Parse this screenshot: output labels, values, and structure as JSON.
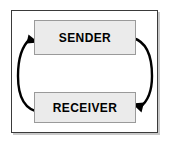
{
  "diagram": {
    "frame": {
      "border_color": "#3a3a3a",
      "shadow_color": "#c9c9c9",
      "background": "#ffffff"
    },
    "nodes": [
      {
        "id": "sender",
        "label": "SENDER",
        "fill": "#ebebeb",
        "border_color": "#9a9a9a",
        "text_color": "#000000"
      },
      {
        "id": "receiver",
        "label": "RECEIVER",
        "fill": "#ebebeb",
        "border_color": "#9a9a9a",
        "text_color": "#000000"
      }
    ],
    "arrows": [
      {
        "id": "receiver-to-sender",
        "from": "receiver",
        "to": "sender",
        "side": "left",
        "color": "#000000",
        "label": ""
      },
      {
        "id": "sender-to-receiver",
        "from": "sender",
        "to": "receiver",
        "side": "right",
        "color": "#000000",
        "label": ""
      }
    ]
  }
}
